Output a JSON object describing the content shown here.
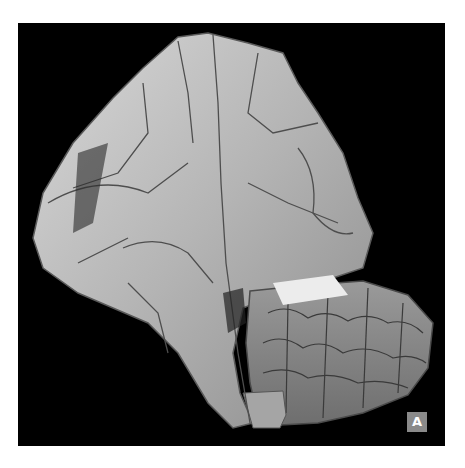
{
  "figure": {
    "panel_label": "A",
    "background_color": "#000000",
    "frame_color": "#ffffff",
    "label_bg_color": "#8a8a8a"
  }
}
